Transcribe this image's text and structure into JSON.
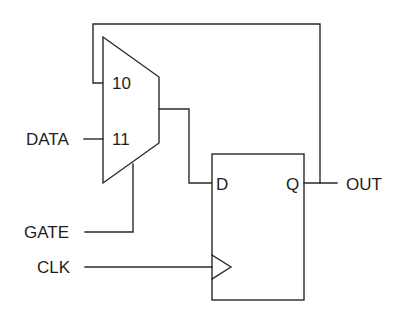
{
  "diagram": {
    "type": "circuit-schematic",
    "colors": {
      "stroke": "#2a2a2a",
      "text": "#1e1e1e",
      "background": "#ffffff"
    },
    "mux": {
      "inputs": [
        {
          "label": "10",
          "source": "OUT (feedback)"
        },
        {
          "label": "11",
          "source": "DATA"
        }
      ],
      "select": "GATE"
    },
    "flip_flop": {
      "d_label": "D",
      "q_label": "Q",
      "clock_symbol": "triangle"
    },
    "signals": {
      "data": "DATA",
      "gate": "GATE",
      "clk": "CLK",
      "out": "OUT"
    }
  }
}
